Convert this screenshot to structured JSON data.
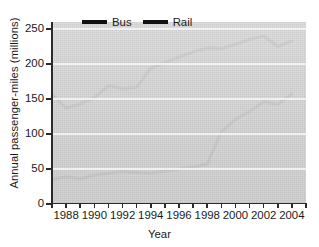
{
  "chart_data": {
    "type": "line",
    "title": "",
    "xlabel": "Year",
    "ylabel": "Annual passenger-miles (millions)",
    "xlim": [
      1987,
      2005
    ],
    "ylim": [
      0,
      260
    ],
    "yticks": [
      0,
      50,
      100,
      150,
      200,
      250
    ],
    "ytick_labels": [
      "0",
      "50",
      "100",
      "150",
      "200",
      "250"
    ],
    "xticks": [
      1987,
      1988,
      1989,
      1990,
      1991,
      1992,
      1993,
      1994,
      1995,
      1996,
      1997,
      1998,
      1999,
      2000,
      2001,
      2002,
      2003,
      2004,
      2005
    ],
    "xtick_labels": [
      "1988",
      "1990",
      "1992",
      "1994",
      "1996",
      "1998",
      "2000",
      "2002",
      "2004"
    ],
    "xtick_labelled_years": [
      1988,
      1990,
      1992,
      1994,
      1996,
      1998,
      2000,
      2002,
      2004
    ],
    "x": [
      1987,
      1988,
      1989,
      1990,
      1991,
      1992,
      1993,
      1994,
      1995,
      1996,
      1997,
      1998,
      1999,
      2000,
      2001,
      2002,
      2003,
      2004
    ],
    "grid": true,
    "grid_color": "#f2f2f2",
    "plot_background": "#d9d9d9",
    "legend_position": "top-center",
    "series": [
      {
        "name": "Bus",
        "color": "#111111",
        "values": [
          157,
          137,
          143,
          152,
          169,
          165,
          167,
          194,
          202,
          210,
          217,
          223,
          222,
          228,
          235,
          240,
          225,
          233
        ]
      },
      {
        "name": "Rail",
        "color": "#111111",
        "values": [
          35,
          39,
          36,
          41,
          44,
          46,
          45,
          44,
          47,
          50,
          53,
          57,
          103,
          121,
          132,
          146,
          142,
          157
        ]
      }
    ]
  },
  "legend": {
    "entries": [
      {
        "label": "Bus"
      },
      {
        "label": "Rail"
      }
    ]
  },
  "axes": {
    "x_title": "Year",
    "y_title": "Annual passenger-miles (millions)"
  }
}
